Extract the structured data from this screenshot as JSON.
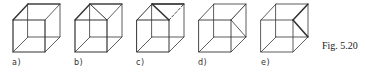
{
  "figure": {
    "caption": "Fig. 5.20",
    "colors": {
      "line": "#333333",
      "background": "#ffffff"
    },
    "panels": [
      {
        "label": "a)",
        "variant": "plain-necker-cube"
      },
      {
        "label": "b)",
        "variant": "top-face-diagonal"
      },
      {
        "label": "c)",
        "variant": "top-face-diagonal-with-dashed-edge"
      },
      {
        "label": "d)",
        "variant": "right-face-diagonal"
      },
      {
        "label": "e)",
        "variant": "right-corner-emphasized"
      }
    ]
  }
}
